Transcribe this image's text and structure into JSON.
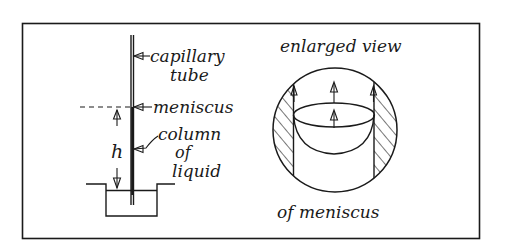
{
  "diagram": {
    "left_panel": {
      "labels": {
        "capillary_tube_line1": "capillary",
        "capillary_tube_line2": "tube",
        "meniscus": "meniscus",
        "column_line1": "column",
        "column_line2": "of",
        "column_line3": "liquid",
        "height_symbol": "h"
      }
    },
    "right_panel": {
      "labels": {
        "top": "enlarged view",
        "bottom": "of meniscus"
      }
    },
    "colors": {
      "ink": "#1a1a1a",
      "background": "#ffffff"
    }
  }
}
